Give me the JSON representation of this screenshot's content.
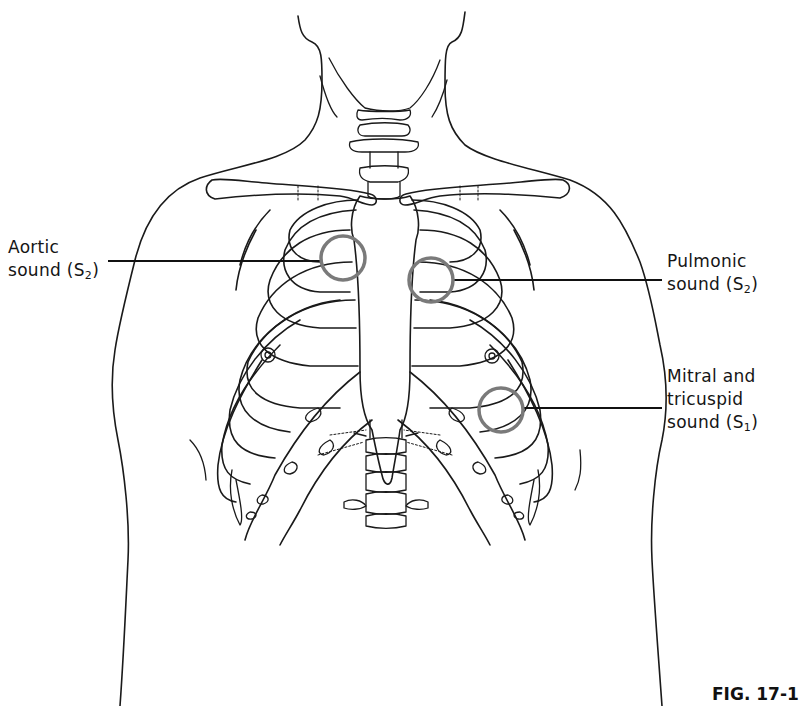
{
  "figure": {
    "caption": "FIG. 17-1",
    "ring_color": "#7a7a7a",
    "line_color": "#1a1a1a"
  },
  "labels": {
    "aortic": {
      "line1": "Aortic",
      "line2_prefix": "sound (S",
      "line2_sub": "2",
      "line2_suffix": ")"
    },
    "pulmonic": {
      "line1": "Pulmonic",
      "line2_prefix": "sound (S",
      "line2_sub": "2",
      "line2_suffix": ")"
    },
    "mitral": {
      "line1": "Mitral and",
      "line2": "tricuspid",
      "line3_prefix": "sound (S",
      "line3_sub": "1",
      "line3_suffix": ")"
    }
  },
  "markers": [
    {
      "name": "aortic-area",
      "cx": 343,
      "cy": 258,
      "r": 22
    },
    {
      "name": "pulmonic-area",
      "cx": 431,
      "cy": 280,
      "r": 22
    },
    {
      "name": "mitral-tricuspid-area",
      "cx": 501,
      "cy": 410,
      "r": 22
    }
  ]
}
